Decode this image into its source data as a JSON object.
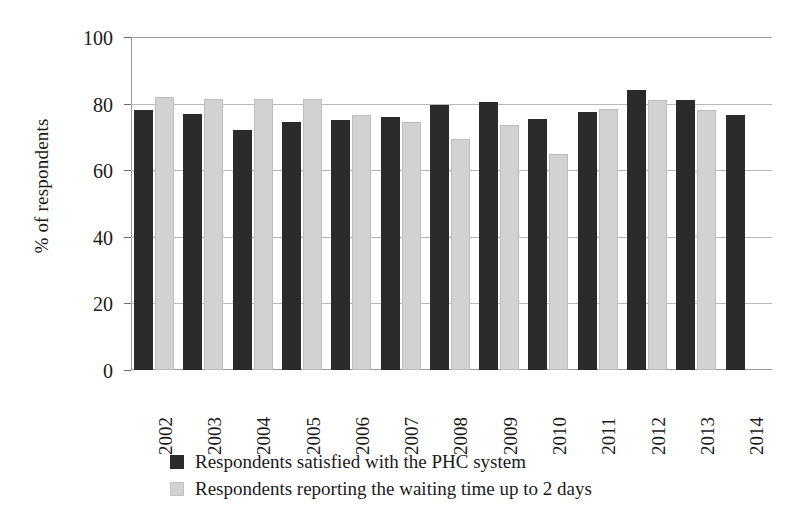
{
  "chart_data": {
    "type": "bar",
    "title": "",
    "xlabel": "",
    "ylabel": "% of respondents",
    "ylim": [
      0,
      100
    ],
    "yticks": [
      0,
      20,
      40,
      60,
      80,
      100
    ],
    "grid": true,
    "legend_position": "bottom",
    "categories": [
      "2002",
      "2003",
      "2004",
      "2005",
      "2006",
      "2007",
      "2008",
      "2009",
      "2010",
      "2011",
      "2012",
      "2013",
      "2014"
    ],
    "series": [
      {
        "name": "Respondents satisfied with the PHC system",
        "color": "#2b2b2b",
        "values": [
          78,
          77,
          72,
          74.5,
          75,
          76,
          79.5,
          80.5,
          75.5,
          77.5,
          84,
          81,
          76.5
        ]
      },
      {
        "name": "Respondents reporting the waiting time up to 2 days",
        "color": "#d2d2d2",
        "values": [
          82,
          81.5,
          81.5,
          81.5,
          76.5,
          74.5,
          69.5,
          73.5,
          65,
          78.5,
          81,
          78,
          null
        ]
      }
    ]
  },
  "legend": {
    "items": [
      {
        "label": "Respondents satisfied with the PHC system",
        "swatch": "dark-square-swatch"
      },
      {
        "label": "Respondents reporting the waiting time up to 2 days",
        "swatch": "light-square-swatch"
      }
    ]
  }
}
